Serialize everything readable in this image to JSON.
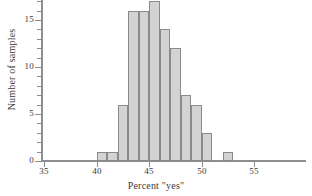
{
  "chart_data": {
    "type": "bar",
    "title": "",
    "xlabel": "Percent \"yes\"",
    "ylabel": "Number of samples",
    "xlim": [
      35,
      60
    ],
    "ylim": [
      0,
      17.8
    ],
    "grid": false,
    "legend": null,
    "bin_width": 1,
    "xticks": [
      35,
      40,
      45,
      50,
      55
    ],
    "xtick_labels": [
      "35",
      "40",
      "45",
      "50",
      "55"
    ],
    "yticks": [
      0,
      5,
      10,
      15
    ],
    "ytick_labels": [
      "0",
      "5",
      "10",
      "15"
    ],
    "yticks_minor": [
      1,
      2,
      3,
      4,
      6,
      7,
      8,
      9,
      11,
      12,
      13,
      14,
      16,
      17
    ],
    "categories": [
      40,
      41,
      42,
      43,
      44,
      45,
      46,
      47,
      48,
      49,
      50,
      51
    ],
    "values": [
      1,
      1,
      6,
      16,
      16,
      17,
      14,
      12,
      7,
      6,
      3,
      1
    ],
    "bars": [
      {
        "bin_start": 40,
        "bin_end": 41,
        "count": 1
      },
      {
        "bin_start": 41,
        "bin_end": 42,
        "count": 1
      },
      {
        "bin_start": 42,
        "bin_end": 43,
        "count": 6
      },
      {
        "bin_start": 43,
        "bin_end": 44,
        "count": 16
      },
      {
        "bin_start": 44,
        "bin_end": 45,
        "count": 16
      },
      {
        "bin_start": 45,
        "bin_end": 46,
        "count": 17
      },
      {
        "bin_start": 46,
        "bin_end": 47,
        "count": 14
      },
      {
        "bin_start": 47,
        "bin_end": 48,
        "count": 12
      },
      {
        "bin_start": 48,
        "bin_end": 49,
        "count": 7
      },
      {
        "bin_start": 49,
        "bin_end": 50,
        "count": 6
      },
      {
        "bin_start": 50,
        "bin_end": 51,
        "count": 3
      },
      {
        "bin_start": 51,
        "bin_end": 52,
        "count": 0
      },
      {
        "bin_start": 52,
        "bin_end": 53,
        "count": 1
      }
    ],
    "colors": {
      "bar_fill": "#d3d3d3",
      "bar_edge": "#8a8a8a",
      "axis": "#8d8d8d",
      "text": "#3a3a3a",
      "background": "#ffffff"
    }
  }
}
